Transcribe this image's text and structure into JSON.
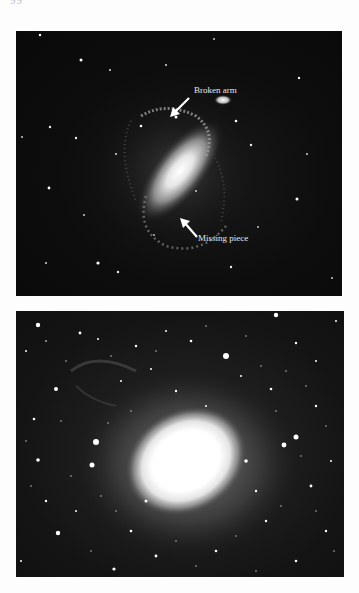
{
  "page": {
    "page_mark": "99"
  },
  "figures": [
    {
      "id": "barred-spiral",
      "annotations": [
        {
          "text": "Broken arm",
          "points_to": "upper spiral arm"
        },
        {
          "text": "Missing piece",
          "points_to": "lower spiral arm gap"
        }
      ]
    },
    {
      "id": "elliptical-galaxy",
      "annotations": []
    }
  ],
  "colors": {
    "page_background": "#fdfdfd",
    "photo_background": "#0b0b0b",
    "label_text": "#e8e8e8"
  }
}
